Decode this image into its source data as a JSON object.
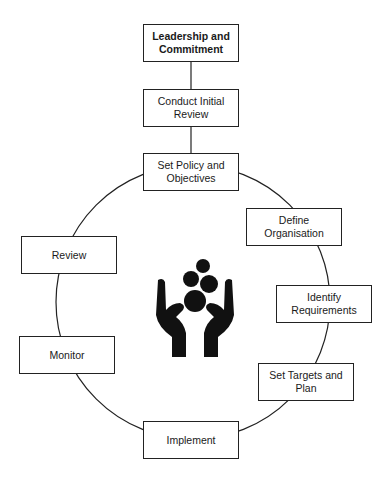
{
  "diagram": {
    "type": "cycle-flow",
    "linear_steps": [
      {
        "id": "leadership",
        "label": "Leadership and Commitment"
      },
      {
        "id": "initial-review",
        "label": "Conduct Initial Review"
      }
    ],
    "cycle_steps": [
      {
        "id": "policy",
        "label": "Set Policy and Objectives"
      },
      {
        "id": "organisation",
        "label": "Define Organisation"
      },
      {
        "id": "requirements",
        "label": "Identify Requirements"
      },
      {
        "id": "targets",
        "label": "Set Targets and Plan"
      },
      {
        "id": "implement",
        "label": "Implement"
      },
      {
        "id": "monitor",
        "label": "Monitor"
      },
      {
        "id": "review",
        "label": "Review"
      }
    ],
    "center_icon": "hands-holding-circles-icon",
    "colors": {
      "stroke": "#222222",
      "icon": "#111111",
      "background": "#ffffff"
    }
  },
  "boxes": {
    "leadership": "Leadership and Commitment",
    "initial_review": "Conduct Initial Review",
    "policy": "Set Policy and Objectives",
    "organisation": "Define Organisation",
    "requirements": "Identify Requirements",
    "targets": "Set Targets and Plan",
    "implement": "Implement",
    "monitor": "Monitor",
    "review": "Review"
  }
}
